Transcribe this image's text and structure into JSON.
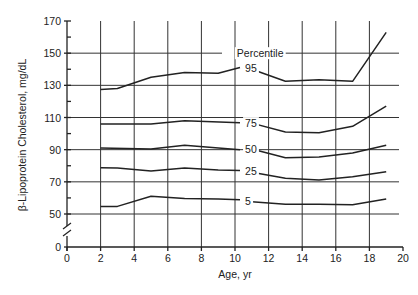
{
  "chart_data": {
    "type": "line",
    "title": "",
    "xlabel": "Age, yr",
    "ylabel": "β-Lipoprotein Cholesterol, mg/dL",
    "xlim": [
      0,
      20
    ],
    "ylim": [
      0,
      170
    ],
    "y_axis_break": true,
    "grid": true,
    "x_ticks": [
      0,
      2,
      4,
      6,
      8,
      10,
      12,
      14,
      16,
      18,
      20
    ],
    "y_ticks": [
      0,
      50,
      70,
      90,
      110,
      130,
      150,
      170
    ],
    "legend_title": "Percentile",
    "series": [
      {
        "name": "95",
        "segments": [
          {
            "x": [
              2,
              3,
              5,
              7,
              9,
              10.3
            ],
            "y": [
              127.5,
              128,
              135,
              138,
              137.5,
              141
            ]
          },
          {
            "x": [
              11,
              13,
              15,
              17,
              19
            ],
            "y": [
              140,
              132.5,
              133.5,
              132.5,
              163
            ]
          }
        ]
      },
      {
        "name": "75",
        "segments": [
          {
            "x": [
              2,
              5,
              7,
              10.3
            ],
            "y": [
              106,
              106,
              108,
              106.7
            ]
          },
          {
            "x": [
              11,
              13,
              15,
              17,
              19
            ],
            "y": [
              106.5,
              101,
              100.5,
              104.5,
              117
            ]
          }
        ]
      },
      {
        "name": "50",
        "segments": [
          {
            "x": [
              2,
              5,
              7,
              10.3
            ],
            "y": [
              91,
              90.5,
              92.8,
              90
            ]
          },
          {
            "x": [
              11,
              13,
              15,
              17,
              19
            ],
            "y": [
              90.4,
              85,
              85.5,
              88,
              92.8
            ]
          }
        ]
      },
      {
        "name": "25",
        "segments": [
          {
            "x": [
              2,
              3,
              5,
              7,
              9,
              10.3
            ],
            "y": [
              78.8,
              78.6,
              76.7,
              78.6,
              77.4,
              77
            ]
          },
          {
            "x": [
              11,
              13,
              15,
              17,
              19
            ],
            "y": [
              76,
              72.2,
              71.2,
              73.2,
              76.3
            ]
          }
        ]
      },
      {
        "name": "5",
        "segments": [
          {
            "x": [
              2,
              3,
              5,
              7,
              9,
              10.3
            ],
            "y": [
              54.7,
              54.7,
              61,
              59.6,
              59.4,
              58.8
            ]
          },
          {
            "x": [
              11,
              13,
              15,
              17,
              19
            ],
            "y": [
              57.6,
              56,
              56,
              55.8,
              59.4
            ]
          }
        ]
      }
    ],
    "annotations": [
      {
        "text": "Percentile",
        "x": 11.5,
        "y": 150
      },
      {
        "text": "95",
        "x": 10.6,
        "y": 140.5
      },
      {
        "text": "75",
        "x": 10.6,
        "y": 106.5
      },
      {
        "text": "50",
        "x": 10.6,
        "y": 90.2
      },
      {
        "text": "25",
        "x": 10.6,
        "y": 76.5
      },
      {
        "text": "5",
        "x": 10.6,
        "y": 58
      }
    ]
  }
}
